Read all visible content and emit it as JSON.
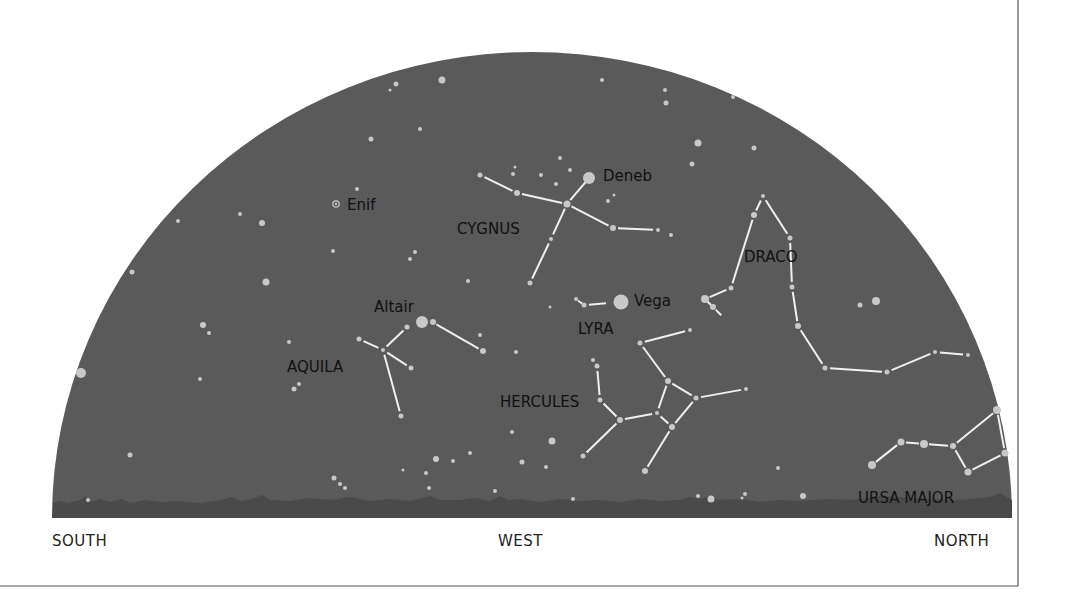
{
  "chart": {
    "sky_color": "#5a5a5a",
    "horizon_color": "#4a4a4a",
    "star_color": "#c8c8c8",
    "line_color": "#f0f0f0",
    "label_color": "#111111",
    "dome": {
      "left": 52,
      "right": 1012,
      "baseline": 518,
      "top": 52
    }
  },
  "compass": {
    "south": "SOUTH",
    "west": "WEST",
    "north": "NORTH"
  },
  "stars_named": [
    {
      "name": "Deneb",
      "x": 589,
      "y": 178,
      "r": 6
    },
    {
      "name": "Vega",
      "x": 621,
      "y": 302,
      "r": 7
    },
    {
      "name": "Altair",
      "x": 422,
      "y": 322,
      "r": 6
    },
    {
      "name": "Enif",
      "x": 336,
      "y": 204,
      "r": 3
    }
  ],
  "labels": {
    "deneb": "Deneb",
    "vega": "Vega",
    "altair": "Altair",
    "enif": "Enif",
    "cygnus": "CYGNUS",
    "draco": "DRACO",
    "lyra": "LYRA",
    "aquila": "AQUILA",
    "hercules": "HERCULES",
    "ursa_major": "URSA MAJOR"
  },
  "constellations": [
    {
      "name": "CYGNUS",
      "lines": [
        [
          480,
          175,
          517,
          193
        ],
        [
          517,
          193,
          567,
          204
        ],
        [
          567,
          204,
          589,
          178
        ],
        [
          567,
          204,
          613,
          228
        ],
        [
          613,
          228,
          658,
          230
        ],
        [
          567,
          204,
          551,
          239
        ],
        [
          551,
          239,
          530,
          283
        ]
      ]
    },
    {
      "name": "LYRA",
      "lines": [
        [
          576,
          299,
          584,
          305
        ],
        [
          584,
          305,
          611,
          303
        ]
      ]
    },
    {
      "name": "AQUILA",
      "lines": [
        [
          359,
          339,
          383,
          350
        ],
        [
          383,
          350,
          407,
          327
        ],
        [
          432,
          322,
          483,
          351
        ],
        [
          383,
          350,
          411,
          368
        ],
        [
          383,
          350,
          401,
          416
        ]
      ]
    },
    {
      "name": "HERCULES",
      "lines": [
        [
          640,
          343,
          690,
          330
        ],
        [
          640,
          343,
          668,
          381
        ],
        [
          668,
          381,
          696,
          398
        ],
        [
          696,
          398,
          746,
          389
        ],
        [
          668,
          381,
          657,
          413
        ],
        [
          657,
          413,
          620,
          420
        ],
        [
          620,
          420,
          600,
          400
        ],
        [
          600,
          400,
          597,
          366
        ],
        [
          657,
          413,
          672,
          427
        ],
        [
          672,
          427,
          696,
          398
        ],
        [
          672,
          427,
          645,
          471
        ],
        [
          620,
          420,
          583,
          456
        ]
      ]
    },
    {
      "name": "DRACO",
      "lines": [
        [
          705,
          299,
          713,
          307
        ],
        [
          705,
          299,
          731,
          288
        ],
        [
          731,
          288,
          754,
          215
        ],
        [
          754,
          215,
          763,
          196
        ],
        [
          763,
          196,
          790,
          238
        ],
        [
          790,
          238,
          792,
          287
        ],
        [
          792,
          287,
          798,
          326
        ],
        [
          798,
          326,
          825,
          368
        ],
        [
          825,
          368,
          887,
          372
        ],
        [
          887,
          372,
          935,
          352
        ],
        [
          935,
          352,
          968,
          355
        ],
        [
          713,
          307,
          724,
          318
        ]
      ]
    },
    {
      "name": "URSA MAJOR",
      "lines": [
        [
          872,
          465,
          901,
          442
        ],
        [
          901,
          442,
          924,
          444
        ],
        [
          924,
          444,
          953,
          446
        ],
        [
          953,
          446,
          997,
          410
        ],
        [
          997,
          410,
          1005,
          453
        ],
        [
          1005,
          453,
          968,
          472
        ],
        [
          968,
          472,
          953,
          446
        ]
      ]
    }
  ],
  "stars": [
    [
      480,
      175,
      2.5
    ],
    [
      517,
      193,
      3
    ],
    [
      567,
      204,
      3.5
    ],
    [
      613,
      228,
      3
    ],
    [
      658,
      230,
      2
    ],
    [
      551,
      239,
      2
    ],
    [
      530,
      283,
      2.5
    ],
    [
      576,
      299,
      2
    ],
    [
      584,
      305,
      2.5
    ],
    [
      359,
      339,
      2.5
    ],
    [
      383,
      350,
      2
    ],
    [
      407,
      327,
      2.5
    ],
    [
      433,
      322,
      3
    ],
    [
      483,
      351,
      3
    ],
    [
      411,
      368,
      2.5
    ],
    [
      401,
      416,
      2.5
    ],
    [
      640,
      343,
      2.5
    ],
    [
      690,
      330,
      2
    ],
    [
      668,
      381,
      3
    ],
    [
      696,
      398,
      2.5
    ],
    [
      746,
      389,
      2
    ],
    [
      657,
      413,
      2
    ],
    [
      620,
      420,
      3
    ],
    [
      600,
      400,
      2.5
    ],
    [
      597,
      366,
      2.5
    ],
    [
      593,
      360,
      2
    ],
    [
      672,
      427,
      3
    ],
    [
      645,
      471,
      3
    ],
    [
      583,
      456,
      2.5
    ],
    [
      705,
      299,
      4
    ],
    [
      713,
      307,
      3
    ],
    [
      731,
      288,
      2.5
    ],
    [
      754,
      215,
      3
    ],
    [
      763,
      196,
      2
    ],
    [
      790,
      238,
      2.5
    ],
    [
      792,
      287,
      2.5
    ],
    [
      798,
      326,
      3
    ],
    [
      825,
      368,
      2.5
    ],
    [
      887,
      372,
      2.5
    ],
    [
      935,
      352,
      2
    ],
    [
      968,
      355,
      2
    ],
    [
      872,
      465,
      4
    ],
    [
      901,
      442,
      3.5
    ],
    [
      924,
      444,
      4
    ],
    [
      953,
      446,
      3
    ],
    [
      997,
      410,
      4
    ],
    [
      1005,
      453,
      3.5
    ],
    [
      968,
      472,
      3.5
    ],
    [
      876,
      301,
      4
    ],
    [
      860,
      305,
      2.5
    ],
    [
      442,
      80,
      3.5
    ],
    [
      396,
      84,
      2.5
    ],
    [
      390,
      90,
      1.5
    ],
    [
      420,
      129,
      2
    ],
    [
      602,
      80,
      2
    ],
    [
      665,
      90,
      2
    ],
    [
      666,
      103,
      2.5
    ],
    [
      733,
      97,
      2
    ],
    [
      698,
      143,
      3.5
    ],
    [
      754,
      148,
      2.5
    ],
    [
      692,
      164,
      2.5
    ],
    [
      560,
      158,
      2
    ],
    [
      570,
      170,
      2
    ],
    [
      556,
      184,
      2
    ],
    [
      541,
      175,
      2
    ],
    [
      608,
      201,
      2
    ],
    [
      614,
      195,
      1.5
    ],
    [
      671,
      235,
      2
    ],
    [
      371,
      139,
      2.5
    ],
    [
      357,
      189,
      2
    ],
    [
      262,
      223,
      3
    ],
    [
      240,
      214,
      2
    ],
    [
      178,
      221,
      2
    ],
    [
      132,
      272,
      2.5
    ],
    [
      266,
      282,
      3.5
    ],
    [
      415,
      252,
      2
    ],
    [
      410,
      259,
      2
    ],
    [
      333,
      251,
      2
    ],
    [
      468,
      281,
      2
    ],
    [
      513,
      174,
      2
    ],
    [
      515,
      167,
      1.5
    ],
    [
      203,
      325,
      3
    ],
    [
      209,
      333,
      2
    ],
    [
      81,
      373,
      5
    ],
    [
      200,
      379,
      2
    ],
    [
      130,
      455,
      2.5
    ],
    [
      88,
      500,
      2
    ],
    [
      289,
      342,
      2
    ],
    [
      299,
      384,
      2
    ],
    [
      294,
      389,
      2.5
    ],
    [
      480,
      335,
      2
    ],
    [
      516,
      352,
      2
    ],
    [
      470,
      453,
      2
    ],
    [
      436,
      459,
      3
    ],
    [
      426,
      473,
      2
    ],
    [
      453,
      461,
      2
    ],
    [
      334,
      478,
      2.5
    ],
    [
      340,
      484,
      2
    ],
    [
      345,
      488,
      2
    ],
    [
      552,
      441,
      3.5
    ],
    [
      512,
      432,
      2
    ],
    [
      550,
      307,
      1.5
    ],
    [
      403,
      470,
      1.5
    ],
    [
      429,
      488,
      2
    ],
    [
      522,
      462,
      2.5
    ],
    [
      546,
      467,
      2
    ],
    [
      495,
      491,
      2
    ],
    [
      573,
      499,
      2
    ],
    [
      711,
      499,
      3.5
    ],
    [
      698,
      496,
      2
    ],
    [
      745,
      494,
      2
    ],
    [
      803,
      496,
      3
    ],
    [
      778,
      468,
      2
    ],
    [
      742,
      498,
      1.5
    ]
  ]
}
